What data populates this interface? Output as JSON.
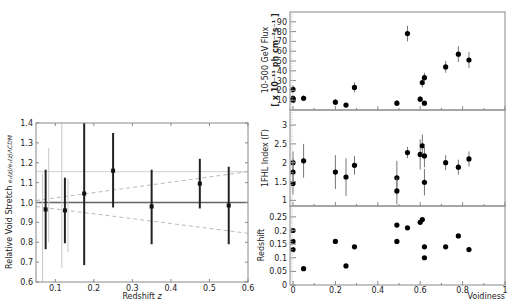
{
  "chart_data": [
    {
      "type": "scatter",
      "title": "",
      "xlabel": "Redshift z",
      "ylabel": "Relative Void Stretch e_v(z)/e_v(z)_ΛCDM",
      "xlim": [
        0.05,
        0.6
      ],
      "ylim": [
        0.6,
        1.4
      ],
      "xticks": [
        "0.1",
        "0.2",
        "0.3",
        "0.4",
        "0.5",
        "0.6"
      ],
      "yticks": [
        "0.6",
        "0.7",
        "0.8",
        "0.9",
        "1.0",
        "1.1",
        "1.2",
        "1.3",
        "1.4"
      ],
      "grid": false,
      "series": [
        {
          "name": "measurements",
          "style": "black points with error bars",
          "points": [
            {
              "x": 0.075,
              "y": 0.965,
              "ylo": 0.765,
              "yhi": 1.165
            },
            {
              "x": 0.125,
              "y": 0.96,
              "ylo": 0.795,
              "yhi": 1.125
            },
            {
              "x": 0.175,
              "y": 1.045,
              "ylo": 0.685,
              "yhi": 1.4
            },
            {
              "x": 0.25,
              "y": 1.16,
              "ylo": 0.975,
              "yhi": 1.35
            },
            {
              "x": 0.35,
              "y": 0.98,
              "ylo": 0.79,
              "yhi": 1.165
            },
            {
              "x": 0.475,
              "y": 1.095,
              "ylo": 0.97,
              "yhi": 1.22
            },
            {
              "x": 0.55,
              "y": 0.985,
              "ylo": 0.79,
              "yhi": 1.18
            }
          ]
        },
        {
          "name": "light gray error bars",
          "style": "light gray vertical lines",
          "points": [
            {
              "x": 0.067,
              "ylo": 0.6,
              "yhi": 1.145
            },
            {
              "x": 0.083,
              "ylo": 0.8,
              "yhi": 1.275
            },
            {
              "x": 0.117,
              "ylo": 0.67,
              "yhi": 1.4
            },
            {
              "x": 0.133,
              "ylo": 0.75,
              "yhi": 1.12
            }
          ]
        }
      ],
      "reference_lines": [
        {
          "name": "unity",
          "y": 1.0,
          "style": "solid dark gray"
        },
        {
          "name": "upper gray",
          "y": 1.155,
          "style": "solid light gray"
        },
        {
          "name": "upper dashed",
          "x": [
            0.05,
            0.6
          ],
          "y": [
            1.01,
            1.155
          ],
          "style": "dashed gray"
        },
        {
          "name": "lower dashed",
          "x": [
            0.05,
            0.6
          ],
          "y": [
            0.98,
            0.845
          ],
          "style": "dashed gray"
        }
      ]
    },
    {
      "type": "scatter",
      "panel": "top",
      "ylabel": "10-500 GeV Flux [x 10^-11 ph cm^-2 s^-1]",
      "xlim": [
        0,
        1
      ],
      "ylim": [
        0,
        100
      ],
      "yticks": [
        "10",
        "20",
        "30",
        "40",
        "50",
        "60",
        "70",
        "80",
        "90"
      ],
      "points": [
        {
          "x": 0.0,
          "y": 21,
          "err": 4
        },
        {
          "x": 0.0,
          "y": 12,
          "err": 3
        },
        {
          "x": 0.0,
          "y": 11,
          "err": 3
        },
        {
          "x": 0.0,
          "y": 10,
          "err": 3
        },
        {
          "x": 0.05,
          "y": 12,
          "err": 3
        },
        {
          "x": 0.2,
          "y": 8,
          "err": 3
        },
        {
          "x": 0.25,
          "y": 5,
          "err": 2
        },
        {
          "x": 0.29,
          "y": 23,
          "err": 5
        },
        {
          "x": 0.49,
          "y": 7,
          "err": 3
        },
        {
          "x": 0.54,
          "y": 78,
          "err": 8
        },
        {
          "x": 0.6,
          "y": 11,
          "err": 3
        },
        {
          "x": 0.61,
          "y": 28,
          "err": 5
        },
        {
          "x": 0.62,
          "y": 7,
          "err": 2
        },
        {
          "x": 0.62,
          "y": 33,
          "err": 5
        },
        {
          "x": 0.72,
          "y": 44,
          "err": 6
        },
        {
          "x": 0.78,
          "y": 57,
          "err": 8
        },
        {
          "x": 0.83,
          "y": 51,
          "err": 8
        }
      ]
    },
    {
      "type": "scatter",
      "panel": "middle",
      "ylabel": "1FHL Index (Γ)",
      "xlim": [
        0,
        1
      ],
      "ylim": [
        0.85,
        3.4
      ],
      "yticks": [
        "1",
        "1.5",
        "2",
        "2.5",
        "3"
      ],
      "points": [
        {
          "x": 0.0,
          "y": 2.0,
          "err": 0.3
        },
        {
          "x": 0.0,
          "y": 1.75,
          "err": 0.35
        },
        {
          "x": 0.0,
          "y": 1.45,
          "err": 0.3
        },
        {
          "x": 0.05,
          "y": 2.05,
          "err": 0.45
        },
        {
          "x": 0.2,
          "y": 1.75,
          "err": 0.45
        },
        {
          "x": 0.25,
          "y": 1.62,
          "err": 0.5
        },
        {
          "x": 0.29,
          "y": 1.93,
          "err": 0.25
        },
        {
          "x": 0.49,
          "y": 1.6,
          "err": 0.45
        },
        {
          "x": 0.49,
          "y": 1.25,
          "err": 0.35
        },
        {
          "x": 0.54,
          "y": 2.27,
          "err": 0.15
        },
        {
          "x": 0.6,
          "y": 2.22,
          "err": 0.4
        },
        {
          "x": 0.61,
          "y": 2.45,
          "err": 0.3
        },
        {
          "x": 0.62,
          "y": 2.18,
          "err": 0.3
        },
        {
          "x": 0.62,
          "y": 1.48,
          "err": 0.35
        },
        {
          "x": 0.72,
          "y": 2.0,
          "err": 0.2
        },
        {
          "x": 0.78,
          "y": 1.88,
          "err": 0.2
        },
        {
          "x": 0.83,
          "y": 2.1,
          "err": 0.2
        }
      ]
    },
    {
      "type": "scatter",
      "panel": "bottom",
      "xlabel": "Voidiness",
      "ylabel": "Redshift",
      "xlim": [
        0,
        1
      ],
      "ylim": [
        0,
        0.29
      ],
      "xticks": [
        "0",
        "0.2",
        "0.4",
        "0.6",
        "0.8",
        "1"
      ],
      "yticks": [
        "0",
        "0.05",
        "0.1",
        "0.15",
        "0.2",
        "0.25"
      ],
      "points": [
        {
          "x": 0.0,
          "y": 0.2
        },
        {
          "x": 0.0,
          "y": 0.16
        },
        {
          "x": 0.0,
          "y": 0.13
        },
        {
          "x": 0.05,
          "y": 0.06
        },
        {
          "x": 0.2,
          "y": 0.16
        },
        {
          "x": 0.25,
          "y": 0.07
        },
        {
          "x": 0.29,
          "y": 0.14
        },
        {
          "x": 0.49,
          "y": 0.22
        },
        {
          "x": 0.49,
          "y": 0.16
        },
        {
          "x": 0.54,
          "y": 0.21
        },
        {
          "x": 0.6,
          "y": 0.23
        },
        {
          "x": 0.61,
          "y": 0.24
        },
        {
          "x": 0.62,
          "y": 0.14
        },
        {
          "x": 0.62,
          "y": 0.1
        },
        {
          "x": 0.72,
          "y": 0.14
        },
        {
          "x": 0.78,
          "y": 0.18
        },
        {
          "x": 0.83,
          "y": 0.13
        }
      ]
    }
  ],
  "labels": {
    "left_xlabel": "Redshift",
    "left_xlabel_var": "z",
    "left_ylabel_main": "Relative Void Stretch ",
    "left_ylabel_math": "eᵥ(z)/eᵥ(z)ΛCDM",
    "top_ylabel_1": "10-500 GeV Flux",
    "top_ylabel_2": "[ x 10⁻¹¹ ph cm⁻²s⁻¹ ]",
    "mid_ylabel": "1FHL Index (Γ)",
    "bot_ylabel": "Redshift",
    "bot_xlabel": "Voidiness"
  }
}
